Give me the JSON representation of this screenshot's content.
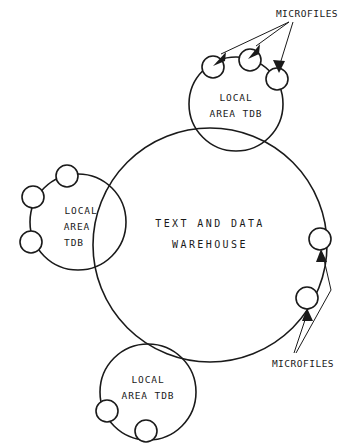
{
  "diagram": {
    "stroke_color": "#1a1a1a",
    "background_color": "#ffffff",
    "center_node": {
      "name": "text-and-data-warehouse",
      "label_line1": "TEXT AND DATA",
      "label_line2": "WAREHOUSE",
      "cx": 210,
      "cy": 245,
      "r": 117
    },
    "local_area_tdbs": [
      {
        "id": "top",
        "name": "local-area-tdb-top",
        "label_line1": "LOCAL",
        "label_line2": "AREA TDB",
        "label_line3": "",
        "cx": 236,
        "cy": 104,
        "r": 47,
        "microfiles": [
          {
            "cx": 213,
            "cy": 67,
            "r": 11
          },
          {
            "cx": 250,
            "cy": 60,
            "r": 11
          },
          {
            "cx": 277,
            "cy": 79,
            "r": 11
          }
        ]
      },
      {
        "id": "left",
        "name": "local-area-tdb-left",
        "label_line1": "LOCAL",
        "label_line2": "AREA",
        "label_line3": "TDB",
        "cx": 78,
        "cy": 222,
        "r": 48,
        "microfiles": [
          {
            "cx": 67,
            "cy": 176,
            "r": 11
          },
          {
            "cx": 33,
            "cy": 197,
            "r": 11
          },
          {
            "cx": 31,
            "cy": 242,
            "r": 11
          }
        ]
      },
      {
        "id": "bottom",
        "name": "local-area-tdb-bottom",
        "label_line1": "LOCAL",
        "label_line2": "AREA TDB",
        "label_line3": "",
        "cx": 148,
        "cy": 392,
        "r": 48,
        "microfiles": [
          {
            "cx": 107,
            "cy": 411,
            "r": 11
          },
          {
            "cx": 146,
            "cy": 431,
            "r": 11
          }
        ]
      }
    ],
    "warehouse_microfiles": [
      {
        "name": "warehouse-microfile-upper",
        "cx": 320,
        "cy": 239,
        "r": 11
      },
      {
        "name": "warehouse-microfile-lower",
        "cx": 307,
        "cy": 298,
        "r": 11
      }
    ],
    "annotations": [
      {
        "id": "microfiles-top",
        "name": "microfiles-label-top",
        "text": "MICROFILES",
        "x": 307,
        "y": 14,
        "anchor_x": 289,
        "anchor_y": 22,
        "arrows": [
          {
            "tip_x": 220,
            "tip_y": 55,
            "angle": 202
          },
          {
            "tip_x": 254,
            "tip_y": 47,
            "angle": 214
          },
          {
            "tip_x": 279,
            "tip_y": 66,
            "angle": 262
          }
        ]
      },
      {
        "id": "microfiles-bottom",
        "name": "microfiles-label-bottom",
        "text": "MICROFILES",
        "x": 303,
        "y": 363,
        "anchor_x": 297,
        "anchor_y": 352,
        "arrows": [
          {
            "tip_x": 322,
            "tip_y": 252,
            "angle": 10
          },
          {
            "tip_x": 308,
            "tip_y": 311,
            "angle": 5
          }
        ]
      }
    ]
  }
}
